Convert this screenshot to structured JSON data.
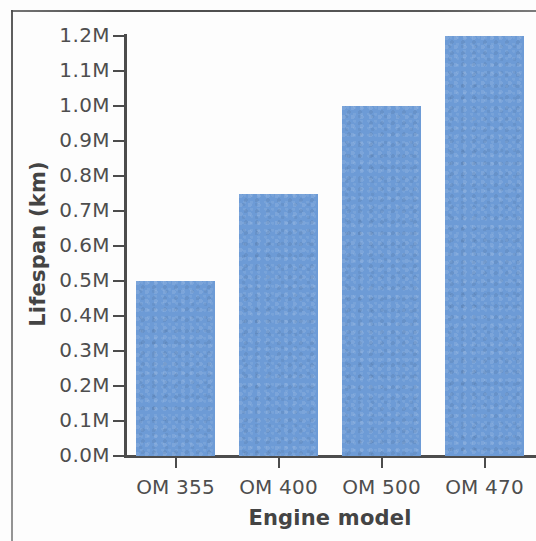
{
  "chart_data": {
    "type": "bar",
    "title": "",
    "categories": [
      "OM 355",
      "OM 400",
      "OM 500",
      "OM 470"
    ],
    "values": [
      0.5,
      0.75,
      1.0,
      1.2
    ],
    "value_labels": [
      "0.5M",
      "0.75M",
      "1.0M",
      "1.2M"
    ],
    "series": [
      {
        "name": "Lifespan (km)",
        "values": [
          0.5,
          0.75,
          1.0,
          1.2
        ]
      }
    ],
    "xlabel": "Engine model",
    "ylabel": "Lifespan (km)",
    "ylim": [
      0.0,
      1.2
    ],
    "ytick_values": [
      0.0,
      0.1,
      0.2,
      0.3,
      0.4,
      0.5,
      0.6,
      0.7,
      0.8,
      0.9,
      1.0,
      1.1,
      1.2
    ],
    "ytick_labels": [
      "1.2M",
      "1.1M",
      "1.0M",
      "0.9M",
      "0.8M",
      "0.7M",
      "0.6M",
      "0.5M",
      "0.4M",
      "0.3M",
      "0.2M",
      "0.1M",
      "0.0M"
    ],
    "grid": false,
    "legend": false,
    "legend_position": "none",
    "bar_color": "#6d9bd6",
    "axis_color": "#4c4c4c",
    "label_color": "#4e4e4e",
    "title_color": "#444444"
  }
}
